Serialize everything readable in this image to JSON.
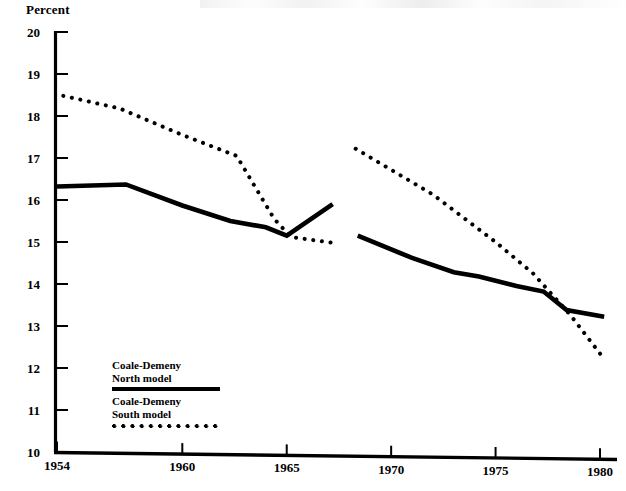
{
  "chart_data": {
    "type": "line",
    "title": "",
    "xlabel": "",
    "ylabel": "Percent",
    "xlim": [
      1953.2,
      1980.6
    ],
    "ylim": [
      10,
      20
    ],
    "xticks": [
      1954,
      1960,
      1965,
      1970,
      1975,
      1980
    ],
    "xtick_labels": [
      "1954",
      "1960",
      "1965",
      "1970",
      "1975",
      "1980"
    ],
    "yticks": [
      10,
      11,
      12,
      13,
      14,
      15,
      16,
      17,
      18,
      19,
      20
    ],
    "ytick_labels": [
      "10",
      "11",
      "12",
      "13",
      "14",
      "15",
      "16",
      "17",
      "18",
      "19",
      "20"
    ],
    "grid": false,
    "legend_position": "lower-left-inset",
    "series": [
      {
        "name": "Coale-Demeny North model",
        "style": "solid",
        "color": "#000000",
        "segments": [
          {
            "x": [
              1954.0,
              1957.3,
              1960.0,
              1962.3,
              1964.0,
              1965.0,
              1967.2
            ],
            "y": [
              16.32,
              16.37,
              15.87,
              15.5,
              15.35,
              15.15,
              15.9
            ]
          },
          {
            "x": [
              1968.4,
              1971.0,
              1973.0,
              1974.2,
              1976.0,
              1977.3,
              1978.4,
              1980.2
            ],
            "y": [
              15.15,
              14.62,
              14.28,
              14.18,
              13.95,
              13.82,
              13.38,
              13.22
            ]
          }
        ]
      },
      {
        "name": "Coale-Demeny South model",
        "style": "dotted",
        "color": "#000000",
        "segments": [
          {
            "x": [
              1954.3,
              1957.0,
              1960.0,
              1962.6,
              1964.4,
              1965.2,
              1967.2
            ],
            "y": [
              18.48,
              18.18,
              17.55,
              17.05,
              15.55,
              15.12,
              14.98
            ]
          },
          {
            "x": [
              1968.3,
              1972.0,
              1975.0,
              1976.8,
              1978.6,
              1980.1
            ],
            "y": [
              17.22,
              16.13,
              15.0,
              14.25,
              13.25,
              12.28
            ]
          }
        ]
      }
    ]
  },
  "legend": {
    "entries": [
      {
        "line1": "Coale-Demeny",
        "line2": "North model",
        "swatch": "solid-line-swatch"
      },
      {
        "line1": "Coale-Demeny",
        "line2": "South model",
        "swatch": "dotted-line-swatch"
      }
    ]
  },
  "axis": {
    "y_title": "Percent"
  }
}
